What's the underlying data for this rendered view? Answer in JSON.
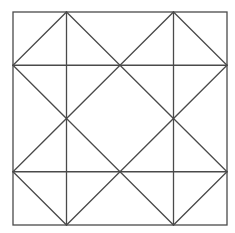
{
  "diagram": {
    "grid_divisions": 4,
    "quadrants": 2,
    "colors": {
      "line": "#4a4a4a",
      "background": "#ffffff"
    },
    "shapes": [
      {
        "name": "outer-square",
        "type": "square"
      },
      {
        "name": "vertical-line-left",
        "type": "line",
        "orientation": "vertical",
        "position_fraction": 0.25
      },
      {
        "name": "vertical-line-right",
        "type": "line",
        "orientation": "vertical",
        "position_fraction": 0.75
      },
      {
        "name": "horizontal-line-top",
        "type": "line",
        "orientation": "horizontal",
        "position_fraction": 0.25
      },
      {
        "name": "horizontal-line-bottom",
        "type": "line",
        "orientation": "horizontal",
        "position_fraction": 0.75
      },
      {
        "name": "diamond-top-left",
        "type": "diamond",
        "quadrant": "top-left"
      },
      {
        "name": "diamond-top-right",
        "type": "diamond",
        "quadrant": "top-right"
      },
      {
        "name": "diamond-bottom-left",
        "type": "diamond",
        "quadrant": "bottom-left"
      },
      {
        "name": "diamond-bottom-right",
        "type": "diamond",
        "quadrant": "bottom-right"
      }
    ]
  }
}
